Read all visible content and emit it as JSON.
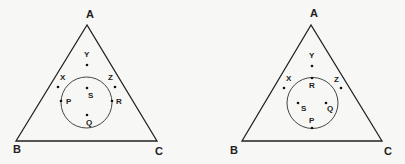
{
  "diagrams": [
    {
      "name": "left-triangle",
      "vertices": {
        "A": "A",
        "B": "B",
        "C": "C"
      },
      "points": {
        "X": "X",
        "Y": "Y",
        "Z": "Z",
        "P": "P",
        "Q": "Q",
        "R": "R",
        "S": "S"
      }
    },
    {
      "name": "right-triangle",
      "vertices": {
        "A": "A",
        "B": "B",
        "C": "C"
      },
      "points": {
        "X": "X",
        "Y": "Y",
        "Z": "Z",
        "P": "P",
        "Q": "Q",
        "R": "R",
        "S": "S"
      }
    }
  ],
  "colors": {
    "stroke": "#222222",
    "background": "#f7f7f5",
    "circle": "#444444"
  }
}
